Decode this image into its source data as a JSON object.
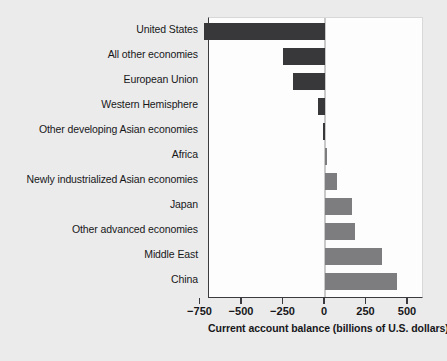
{
  "chart_data": {
    "type": "bar",
    "orientation": "horizontal",
    "title": "",
    "xlabel": "Current account balance (billions of U.S. dollars)",
    "ylabel": "",
    "xlim": [
      -800,
      560
    ],
    "xticks": [
      -750,
      -500,
      -250,
      0,
      250,
      500
    ],
    "xtick_labels": [
      "−750",
      "−500",
      "−250",
      "0",
      "250",
      "500"
    ],
    "grid": false,
    "legend": false,
    "units": "billions of U.S. dollars",
    "categories": [
      "United States",
      "All other economies",
      "European Union",
      "Western Hemisphere",
      "Other developing Asian economies",
      "Africa",
      "Newly industrialized Asian economies",
      "Japan",
      "Other advanced economies",
      "Middle East",
      "China"
    ],
    "values": [
      -730,
      -255,
      -195,
      -40,
      -15,
      5,
      75,
      160,
      180,
      345,
      435
    ],
    "colors": {
      "negative_bar": "#38383b",
      "positive_bar": "#7d7d80",
      "plot_background": "#fdfdfd",
      "figure_background": "#ebebeb",
      "axis_line": "#3b3b3f",
      "zero_line": "#c9c9c9",
      "text": "#17171a"
    }
  },
  "axis": {
    "title": "Current account balance (billions of U.S. dollars)"
  }
}
